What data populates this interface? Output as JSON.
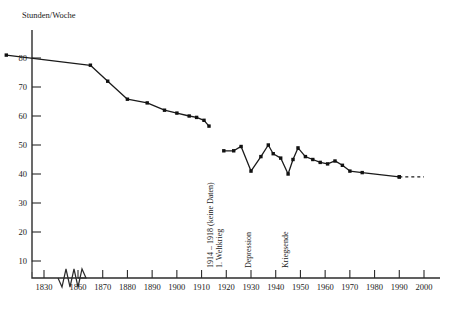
{
  "axis_title": "Stunden/Woche",
  "chart_data": {
    "type": "line",
    "title": "Stunden/Woche",
    "xlabel": "",
    "ylabel": "Stunden/Woche",
    "xlim": [
      1830,
      2000
    ],
    "ylim": [
      0,
      85
    ],
    "grid": false,
    "legend": "none",
    "x_axis_break": true,
    "x_break_between": [
      1832,
      1858
    ],
    "y_axis_break": true,
    "y_ticks": [
      10,
      20,
      30,
      40,
      50,
      60,
      70,
      80
    ],
    "x_ticks": [
      1830,
      1860,
      1870,
      1880,
      1890,
      1900,
      1910,
      1920,
      1930,
      1940,
      1950,
      1960,
      1970,
      1980,
      1990,
      2000
    ],
    "series": [
      {
        "name": "Wochenarbeitszeit vor dem Ersten Weltkrieg",
        "style": "solid",
        "x": [
          1831,
          1865,
          1872,
          1880,
          1888,
          1895,
          1900,
          1905,
          1908,
          1911,
          1913
        ],
        "values": [
          81,
          77.5,
          72,
          65.8,
          64.5,
          62,
          61,
          60,
          59.5,
          58.5,
          56.5
        ]
      },
      {
        "name": "Wochenarbeitszeit nach dem Ersten Weltkrieg",
        "style": "solid",
        "x": [
          1919,
          1923,
          1926,
          1930,
          1934,
          1937,
          1939,
          1942,
          1945,
          1947,
          1949,
          1952,
          1955,
          1958,
          1961,
          1964,
          1967,
          1970,
          1975,
          1990
        ],
        "values": [
          48,
          48,
          49.5,
          41,
          46,
          50,
          47,
          45.5,
          40,
          45,
          49,
          46,
          45,
          44,
          43.5,
          44.5,
          43,
          41,
          40.5,
          39
        ]
      },
      {
        "name": "Prognose",
        "style": "dashed",
        "x": [
          1990,
          2000
        ],
        "values": [
          39,
          39
        ]
      }
    ],
    "annotations": [
      {
        "name": "weltkrieg",
        "lines": [
          "1914 – 1918 (keine Daten)",
          "1. Weltkrieg"
        ],
        "x": 1915,
        "orientation": "vertical"
      },
      {
        "name": "depression",
        "lines": [
          "Depression"
        ],
        "x": 1930,
        "orientation": "vertical"
      },
      {
        "name": "kriegsende",
        "lines": [
          "Kriegsende"
        ],
        "x": 1945,
        "orientation": "vertical"
      }
    ]
  },
  "y_tick_labels": [
    "80",
    "70",
    "60",
    "50",
    "40",
    "30",
    "20",
    "10"
  ],
  "x_tick_labels": [
    "1830",
    "1860",
    "1870",
    "1880",
    "1890",
    "1900",
    "1910",
    "1920",
    "1930",
    "1940",
    "1950",
    "1960",
    "1970",
    "1980",
    "1990",
    "2000"
  ],
  "annotation_labels": {
    "weltkrieg_line1": "1914 – 1918 (keine Daten)",
    "weltkrieg_line2": "1. Weltkrieg",
    "depression": "Depression",
    "kriegsende": "Kriegsende"
  },
  "colors": {
    "line": "#1a1a1a",
    "axis": "#2b2b2b",
    "text": "#1a1a1a",
    "background": "#ffffff"
  }
}
